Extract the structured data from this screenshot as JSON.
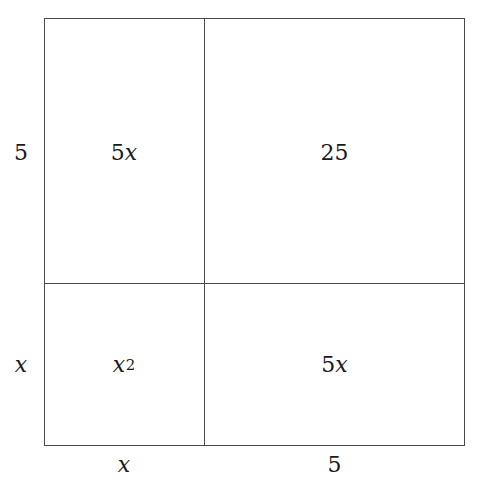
{
  "figure": {
    "type": "area-model-grid",
    "background_color": "#ffffff",
    "line_color": "#4a4a4a",
    "text_color": "#1a1a1a"
  },
  "cells": {
    "top_left": {
      "coefficient": "5",
      "variable": "x",
      "exponent": "",
      "display": "5x"
    },
    "top_right": {
      "coefficient": "25",
      "variable": "",
      "exponent": "",
      "display": "25"
    },
    "bottom_left": {
      "coefficient": "",
      "variable": "x",
      "exponent": "2",
      "display": "x2"
    },
    "bottom_right": {
      "coefficient": "5",
      "variable": "x",
      "exponent": "",
      "display": "5x"
    }
  },
  "edge_labels": {
    "left_top": "5",
    "left_bottom": "x",
    "bottom_left": "x",
    "bottom_right": "5"
  },
  "chart_data": {
    "type": "table",
    "title": "",
    "xlabel": "",
    "ylabel": "",
    "row_headers": [
      "5",
      "x"
    ],
    "column_headers": [
      "x",
      "5"
    ],
    "cells": [
      [
        "5x",
        "25"
      ],
      [
        "x^2",
        "5x"
      ]
    ]
  }
}
